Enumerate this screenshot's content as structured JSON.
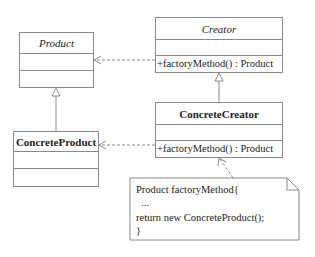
{
  "diagram": {
    "type": "UML class diagram",
    "classes": [
      {
        "id": "product",
        "name": "Product",
        "abstract": true,
        "attributes": [],
        "operations": []
      },
      {
        "id": "creator",
        "name": "Creator",
        "abstract": true,
        "attributes": [],
        "operations": [
          "+factoryMethod() : Product"
        ]
      },
      {
        "id": "concrete_creator",
        "name": "ConcreteCreator",
        "abstract": false,
        "attributes": [],
        "operations": [
          "+factoryMethod() : Product"
        ]
      },
      {
        "id": "concrete_product",
        "name": "ConcreteProduct",
        "abstract": false,
        "attributes": [],
        "operations": []
      }
    ],
    "relations": [
      {
        "from": "concrete_product",
        "to": "product",
        "kind": "generalization"
      },
      {
        "from": "concrete_creator",
        "to": "creator",
        "kind": "generalization"
      },
      {
        "from": "creator",
        "to": "product",
        "kind": "dependency"
      },
      {
        "from": "concrete_creator",
        "to": "concrete_product",
        "kind": "dependency"
      },
      {
        "from": "note",
        "to": "concrete_creator",
        "kind": "note-anchor"
      }
    ],
    "note": {
      "lines": [
        "Product factoryMethod{",
        "  ...",
        "return new ConcreteProduct();",
        "}"
      ]
    }
  }
}
